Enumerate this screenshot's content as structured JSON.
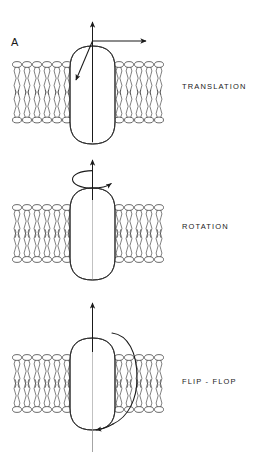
{
  "figure": {
    "panel_letter": "A",
    "caption_labels": {
      "translation": "TRANSLATION",
      "rotation": "ROTATION",
      "flip_flop": "FLIP - FLOP"
    }
  },
  "colors": {
    "ink": "#1a1a1a",
    "line": "#2b2b2b",
    "lipid_stroke": "#3a3a3a",
    "protein_stroke": "#2b2b2b",
    "protein_fill": "#ffffff",
    "stipple": "#8a8a8a",
    "background": "#ffffff"
  },
  "panels": [
    {
      "id": "translation",
      "label": "TRANSLATION",
      "motion": "lateral and vertical displacement",
      "bilayer": {
        "top": 62,
        "bottom": 122,
        "left": 12,
        "right": 160
      },
      "protein": {
        "x": 70,
        "y": 46,
        "width": 45,
        "height": 98
      },
      "arrows": [
        {
          "name": "axis-arrow-up",
          "direction": "up"
        },
        {
          "name": "translation-arrow-right",
          "direction": "right"
        },
        {
          "name": "translation-arrow-diagonal",
          "direction": "down-left"
        }
      ]
    },
    {
      "id": "rotation",
      "label": "ROTATION",
      "motion": "rotation about the membrane normal axis",
      "bilayer": {
        "top": 205,
        "bottom": 262,
        "left": 12,
        "right": 160
      },
      "protein": {
        "x": 70,
        "y": 188,
        "width": 45,
        "height": 92
      },
      "arrows": [
        {
          "name": "axis-arrow-up",
          "direction": "up"
        },
        {
          "name": "rotation-arrow-elliptical",
          "direction": "clockwise"
        }
      ]
    },
    {
      "id": "flip-flop",
      "label": "FLIP - FLOP",
      "motion": "transverse flip across the bilayer",
      "bilayer": {
        "top": 355,
        "bottom": 412,
        "left": 12,
        "right": 160
      },
      "protein": {
        "x": 70,
        "y": 338,
        "width": 45,
        "height": 92
      },
      "arrows": [
        {
          "name": "axis-arrow-up",
          "direction": "up"
        },
        {
          "name": "flip-flop-arc-arrow",
          "direction": "over-and-down"
        }
      ]
    }
  ]
}
